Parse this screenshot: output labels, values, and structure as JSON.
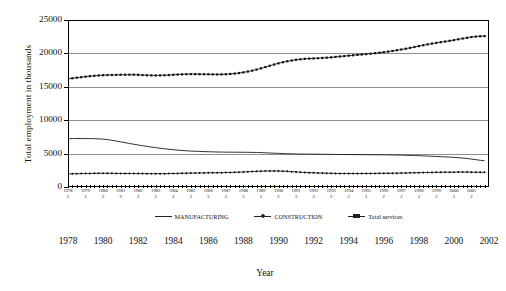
{
  "chart_data": {
    "type": "line",
    "title": "",
    "xlabel": "Year",
    "ylabel": "Total employment in thousands",
    "ylim": [
      0,
      25000
    ],
    "ytick_labels": [
      "0",
      "5000",
      "10000",
      "15000",
      "20000",
      "25000"
    ],
    "ytick_values": [
      0,
      5000,
      10000,
      15000,
      20000,
      25000
    ],
    "grid": true,
    "legend_position": "bottom",
    "xlim": [
      1978,
      2002
    ],
    "x_quarter_label": "2",
    "xtick_years": [
      1978,
      1979,
      1980,
      1981,
      1982,
      1983,
      1984,
      1985,
      1986,
      1987,
      1988,
      1989,
      1990,
      1991,
      1992,
      1993,
      1994,
      1995,
      1996,
      1997,
      1998,
      1999,
      2000,
      2001
    ],
    "xtick_years_lower": [
      1978,
      1980,
      1982,
      1984,
      1986,
      1988,
      1990,
      1992,
      1994,
      1996,
      1998,
      2000,
      2002
    ],
    "x_quarterly": [
      1978.0,
      1978.25,
      1978.5,
      1978.75,
      1979.0,
      1979.25,
      1979.5,
      1979.75,
      1980.0,
      1980.25,
      1980.5,
      1980.75,
      1981.0,
      1981.25,
      1981.5,
      1981.75,
      1982.0,
      1982.25,
      1982.5,
      1982.75,
      1983.0,
      1983.25,
      1983.5,
      1983.75,
      1984.0,
      1984.25,
      1984.5,
      1984.75,
      1985.0,
      1985.25,
      1985.5,
      1985.75,
      1986.0,
      1986.25,
      1986.5,
      1986.75,
      1987.0,
      1987.25,
      1987.5,
      1987.75,
      1988.0,
      1988.25,
      1988.5,
      1988.75,
      1989.0,
      1989.25,
      1989.5,
      1989.75,
      1990.0,
      1990.25,
      1990.5,
      1990.75,
      1991.0,
      1991.25,
      1991.5,
      1991.75,
      1992.0,
      1992.25,
      1992.5,
      1992.75,
      1993.0,
      1993.25,
      1993.5,
      1993.75,
      1994.0,
      1994.25,
      1994.5,
      1994.75,
      1995.0,
      1995.25,
      1995.5,
      1995.75,
      1996.0,
      1996.25,
      1996.5,
      1996.75,
      1997.0,
      1997.25,
      1997.5,
      1997.75,
      1998.0,
      1998.25,
      1998.5,
      1998.75,
      1999.0,
      1999.25,
      1999.5,
      1999.75,
      2000.0,
      2000.25,
      2000.5,
      2000.75,
      2001.0,
      2001.25,
      2001.5,
      2001.75
    ],
    "series": [
      {
        "name": "MANUFACTURING",
        "style": "solid-line",
        "values": [
          7220,
          7250,
          7260,
          7255,
          7250,
          7240,
          7230,
          7200,
          7160,
          7090,
          6990,
          6880,
          6760,
          6640,
          6520,
          6400,
          6290,
          6180,
          6080,
          5980,
          5890,
          5800,
          5720,
          5650,
          5580,
          5520,
          5470,
          5420,
          5380,
          5350,
          5320,
          5300,
          5280,
          5260,
          5240,
          5230,
          5220,
          5215,
          5210,
          5205,
          5200,
          5190,
          5180,
          5170,
          5150,
          5120,
          5090,
          5060,
          5030,
          5000,
          4980,
          4960,
          4940,
          4930,
          4925,
          4920,
          4915,
          4910,
          4900,
          4890,
          4880,
          4870,
          4865,
          4860,
          4855,
          4850,
          4845,
          4840,
          4835,
          4830,
          4825,
          4820,
          4815,
          4805,
          4795,
          4785,
          4770,
          4750,
          4730,
          4710,
          4690,
          4660,
          4630,
          4600,
          4570,
          4540,
          4510,
          4480,
          4440,
          4390,
          4330,
          4260,
          4180,
          4090,
          4000,
          3930
        ]
      },
      {
        "name": "CONSTRUCTION",
        "style": "dashed-line-diamond-markers",
        "values": [
          1960,
          1980,
          2000,
          2010,
          2020,
          2030,
          2040,
          2045,
          2050,
          2045,
          2040,
          2035,
          2030,
          2025,
          2020,
          2015,
          2010,
          2005,
          2000,
          1998,
          1995,
          1995,
          2000,
          2010,
          2020,
          2035,
          2050,
          2065,
          2080,
          2090,
          2100,
          2110,
          2120,
          2130,
          2140,
          2150,
          2165,
          2180,
          2200,
          2220,
          2250,
          2280,
          2310,
          2340,
          2370,
          2390,
          2400,
          2400,
          2390,
          2370,
          2340,
          2300,
          2260,
          2220,
          2180,
          2150,
          2120,
          2100,
          2080,
          2060,
          2040,
          2030,
          2020,
          2015,
          2010,
          2010,
          2015,
          2020,
          2025,
          2030,
          2035,
          2040,
          2045,
          2050,
          2060,
          2070,
          2085,
          2100,
          2115,
          2130,
          2145,
          2160,
          2175,
          2185,
          2195,
          2205,
          2215,
          2220,
          2225,
          2230,
          2235,
          2230,
          2225,
          2215,
          2205,
          2195
        ]
      },
      {
        "name": "Total services",
        "style": "dotted-line-square-markers",
        "values": [
          16200,
          16280,
          16360,
          16440,
          16520,
          16590,
          16650,
          16700,
          16740,
          16760,
          16770,
          16780,
          16800,
          16810,
          16815,
          16810,
          16790,
          16760,
          16730,
          16710,
          16700,
          16710,
          16730,
          16760,
          16800,
          16840,
          16870,
          16890,
          16900,
          16900,
          16890,
          16880,
          16870,
          16860,
          16855,
          16860,
          16880,
          16920,
          16980,
          17060,
          17160,
          17280,
          17420,
          17580,
          17760,
          17950,
          18150,
          18340,
          18520,
          18680,
          18820,
          18940,
          19040,
          19120,
          19180,
          19220,
          19250,
          19280,
          19320,
          19360,
          19410,
          19470,
          19540,
          19600,
          19660,
          19720,
          19780,
          19840,
          19900,
          19960,
          20030,
          20100,
          20180,
          20270,
          20370,
          20470,
          20580,
          20700,
          20830,
          20960,
          21090,
          21220,
          21350,
          21470,
          21580,
          21680,
          21780,
          21880,
          21990,
          22110,
          22230,
          22340,
          22440,
          22520,
          22570,
          22590
        ]
      }
    ]
  },
  "legend": {
    "items": [
      {
        "label": "MANUFACTURING",
        "marker": "line"
      },
      {
        "label": "CONSTRUCTION",
        "marker": "diamond"
      },
      {
        "label": "Total services",
        "marker": "square"
      }
    ]
  },
  "axis_titles": {
    "x": "Year",
    "y": "Total employment in thousands"
  }
}
